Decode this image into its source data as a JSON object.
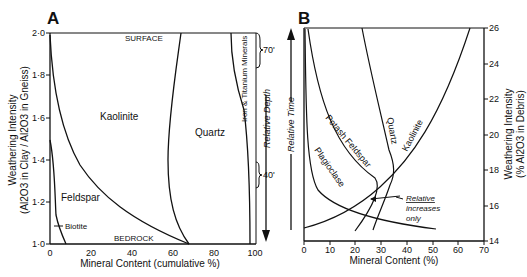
{
  "chart_data": [
    {
      "panel": "A",
      "type": "area",
      "title": "A",
      "xlabel": "Mineral Content (cumulative %)",
      "ylabel_line1": "Weathering Intensity",
      "ylabel_line2": "(Al2O3 in Clay / Al2O3 in Gneiss)",
      "xlim": [
        0,
        100
      ],
      "ylim": [
        1.0,
        2.0
      ],
      "xticks": [
        "0",
        "20",
        "40",
        "60",
        "80",
        "100"
      ],
      "yticks": [
        "1·0",
        "1·2",
        "1·4",
        "1·6",
        "1·8",
        "2·0"
      ],
      "top_label": "SURFACE",
      "bottom_label": "BEDROCK",
      "right_axis_label": "Relative Depth",
      "brackets": [
        {
          "label": "70'",
          "y_range": [
            1.8,
            2.0
          ]
        },
        {
          "label": "40'",
          "y_range": [
            1.2,
            1.35
          ]
        }
      ],
      "series": [
        {
          "name": "Biotite",
          "boundary": [
            [
              8,
              1.0
            ],
            [
              3,
              1.1
            ],
            [
              2,
              1.2
            ],
            [
              1,
              1.4
            ]
          ]
        },
        {
          "name": "Feldspar",
          "boundary": [
            [
              68,
              1.0
            ],
            [
              55,
              1.05
            ],
            [
              38,
              1.15
            ],
            [
              22,
              1.3
            ],
            [
              12,
              1.5
            ],
            [
              5,
              1.7
            ],
            [
              1,
              1.9
            ],
            [
              0,
              2.0
            ]
          ]
        },
        {
          "name": "Kaolinite",
          "boundary": [
            [
              68,
              1.0
            ],
            [
              65,
              1.2
            ],
            [
              64,
              1.4
            ],
            [
              65,
              1.6
            ],
            [
              68,
              1.8
            ],
            [
              72,
              2.0
            ]
          ]
        },
        {
          "name": "Quartz",
          "boundary": [
            [
              97,
              1.0
            ],
            [
              97,
              1.3
            ],
            [
              96,
              1.6
            ],
            [
              95,
              1.8
            ],
            [
              95,
              2.0
            ]
          ]
        },
        {
          "name": "Iron & Titanium Minerals",
          "boundary": [
            [
              100,
              1.0
            ],
            [
              100,
              2.0
            ]
          ]
        }
      ],
      "region_labels": [
        "Kaolinite",
        "Quartz",
        "Feldspar",
        "Biotite",
        "Iron & Titanium Minerals"
      ]
    },
    {
      "panel": "B",
      "type": "line",
      "title": "B",
      "xlabel": "Mineral Content (%)",
      "ylabel_line1": "Weathering Intensity",
      "ylabel_line2": "(% Al2O3 in Debris)",
      "left_axis_label": "Relative Time",
      "xlim": [
        0,
        70
      ],
      "ylim": [
        14,
        26
      ],
      "xticks": [
        "0",
        "10",
        "20",
        "30",
        "40",
        "50",
        "60",
        "70"
      ],
      "yticks": [
        "14",
        "16",
        "18",
        "20",
        "22",
        "24",
        "26"
      ],
      "annotation": "Relative increases only",
      "series": [
        {
          "name": "Plagioclase",
          "points": [
            [
              1,
              26
            ],
            [
              1,
              22
            ],
            [
              3,
              19
            ],
            [
              8,
              17
            ],
            [
              20,
              16
            ],
            [
              35,
              15
            ],
            [
              45,
              14.6
            ]
          ]
        },
        {
          "name": "Potash Feldspar",
          "points": [
            [
              2,
              26
            ],
            [
              5,
              23.5
            ],
            [
              10,
              21
            ],
            [
              18,
              19
            ],
            [
              26,
              17.5
            ],
            [
              28,
              16.5
            ],
            [
              26,
              15.5
            ],
            [
              20,
              14.5
            ]
          ]
        },
        {
          "name": "Quartz",
          "points": [
            [
              28,
              26
            ],
            [
              30,
              23
            ],
            [
              33,
              20
            ],
            [
              36,
              18
            ],
            [
              38,
              17
            ],
            [
              36,
              15.5
            ],
            [
              30,
              14.3
            ]
          ]
        },
        {
          "name": "Kaolinite",
          "points": [
            [
              0,
              15
            ],
            [
              10,
              16
            ],
            [
              20,
              17
            ],
            [
              30,
              18.2
            ],
            [
              40,
              20
            ],
            [
              50,
              22.3
            ],
            [
              60,
              24.5
            ],
            [
              65,
              26
            ]
          ]
        }
      ]
    }
  ]
}
